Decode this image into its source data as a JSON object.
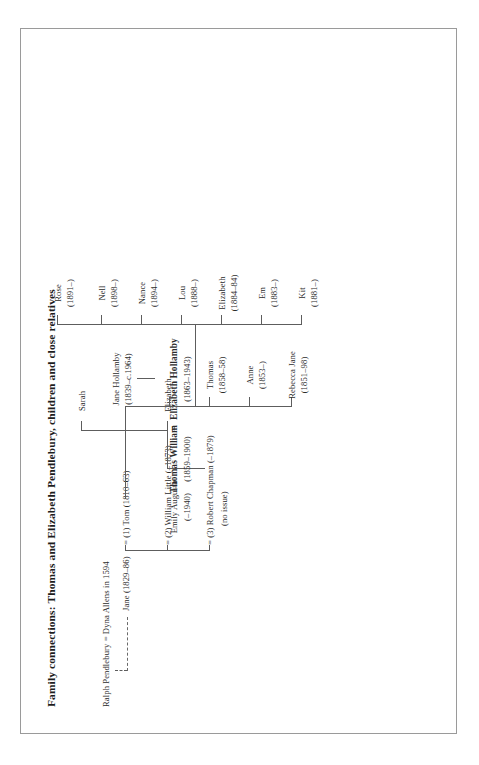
{
  "document": {
    "title": "Family connections: Thomas and Elizabeth Pendlebury, children and close relatives",
    "orientation": "rotated-90-ccw",
    "ink_color": "#2b2b2b",
    "rule_color": "#5d5d5d"
  },
  "tree": {
    "root": {
      "text": "Ralph Pendlebury = Dyna Allens in 1594"
    },
    "generation_2": {
      "jane": "Jane (1829–86)",
      "marriage_1": "= (1) Tom (1810–63)",
      "marriage_2": "= (2) William Little (–1873)",
      "marriage_3": "= (3) Robert Chapman (–1879)",
      "marriage_3_note": "(no issue)"
    },
    "little_children": [
      {
        "name": "Elizabeth",
        "dates": ""
      },
      {
        "name": "Sarah",
        "dates": ""
      }
    ],
    "hollamby_parent": {
      "name": "Jane Hollamby",
      "dates": "(1839–c.1964)"
    },
    "main_couple": {
      "husband_name": "Thomas William",
      "husband_dates": "(1859–1900)",
      "equals": "=",
      "wife_name": "Elizabeth Hollamby",
      "wife_dates": "(1863–1943)"
    },
    "tom_jane_children": [
      {
        "name": "Rebecca Jane",
        "dates": "(1851–98)"
      },
      {
        "name": "Anne",
        "dates": "(1853–)"
      },
      {
        "name": "Thomas",
        "dates": "(1858–58)"
      },
      {
        "name": "Emily Augusta",
        "dates": "(–1940)"
      }
    ],
    "grandchildren": [
      {
        "name": "Kit",
        "dates": "(1881–)"
      },
      {
        "name": "Em",
        "dates": "(1883–)"
      },
      {
        "name": "Elizabeth",
        "dates": "(1884–84)"
      },
      {
        "name": "Lou",
        "dates": "(1888–)"
      },
      {
        "name": "Rose",
        "dates": "(1891–)"
      },
      {
        "name": "Nance",
        "dates": "(1894–)"
      },
      {
        "name": "Nell",
        "dates": "(1898–)"
      }
    ]
  }
}
